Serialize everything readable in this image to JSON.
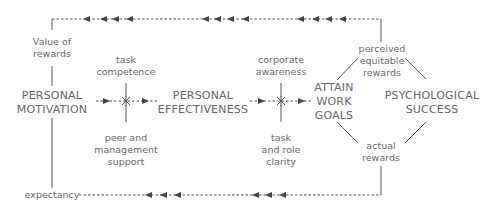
{
  "diagram": {
    "nodes": {
      "personal_motivation": [
        "PERSONAL",
        "MOTIVATION"
      ],
      "personal_effectiveness": [
        "PERSONAL",
        "EFFECTIVENESS"
      ],
      "attain_work_goals": [
        "ATTAIN",
        "WORK",
        "GOALS"
      ],
      "psychological_success": [
        "PSYCHOLOGICAL",
        "SUCCESS"
      ]
    },
    "labels": {
      "value_of_rewards": [
        "Value of",
        "rewards"
      ],
      "task_competence": [
        "task",
        "competence"
      ],
      "peer_management_support": [
        "peer and",
        "management",
        "support"
      ],
      "corporate_awareness": [
        "corporate",
        "awareness"
      ],
      "task_role_clarity": [
        "task",
        "and role",
        "clarity"
      ],
      "perceived_equitable_rewards": [
        "perceived",
        "equitable",
        "rewards"
      ],
      "actual_rewards": [
        "actual",
        "rewards"
      ],
      "expectancy": "expectancy"
    },
    "colors": {
      "line": "#555555",
      "arrow": "#444444",
      "text": "#666666"
    }
  }
}
